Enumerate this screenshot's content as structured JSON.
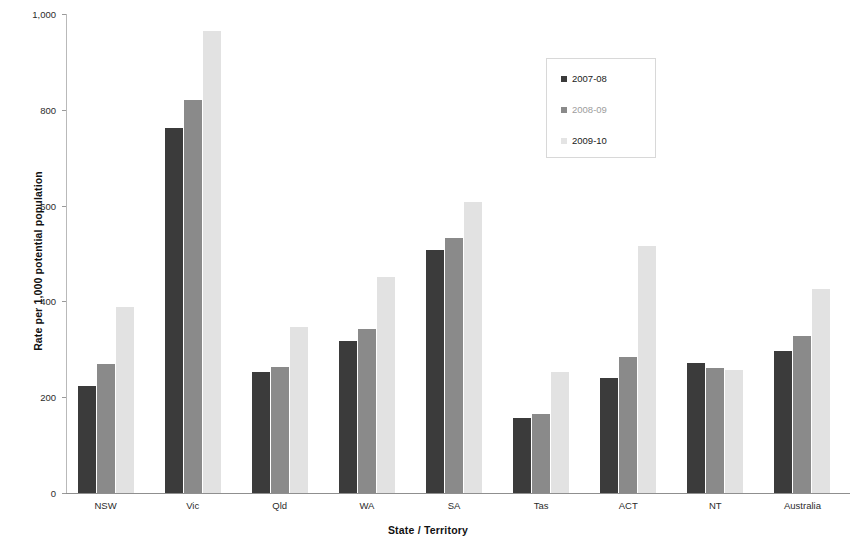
{
  "chart_data": {
    "type": "bar",
    "title": "",
    "xlabel": "State / Territory",
    "ylabel": "Rate per 1,000 potential population",
    "categories": [
      "NSW",
      "Vic",
      "Qld",
      "WA",
      "SA",
      "Tas",
      "ACT",
      "NT",
      "Australia"
    ],
    "series": [
      {
        "name": "2007-08",
        "color": "#3b3b3b",
        "values": [
          224,
          762,
          253,
          317,
          507,
          157,
          240,
          271,
          297
        ]
      },
      {
        "name": "2008-09",
        "color": "#8a8a8a",
        "values": [
          270,
          820,
          263,
          343,
          533,
          165,
          285,
          261,
          327
        ]
      },
      {
        "name": "2009-10",
        "color": "#e2e2e2",
        "values": [
          388,
          965,
          347,
          450,
          607,
          252,
          515,
          256,
          425
        ]
      }
    ],
    "ylim": [
      0,
      1000
    ],
    "yticks": [
      0,
      200,
      400,
      600,
      800,
      1000
    ],
    "ytick_labels": [
      "0",
      "200",
      "400",
      "600",
      "800",
      "1,000"
    ],
    "grid": false,
    "legend_position": "upper-center-right"
  }
}
